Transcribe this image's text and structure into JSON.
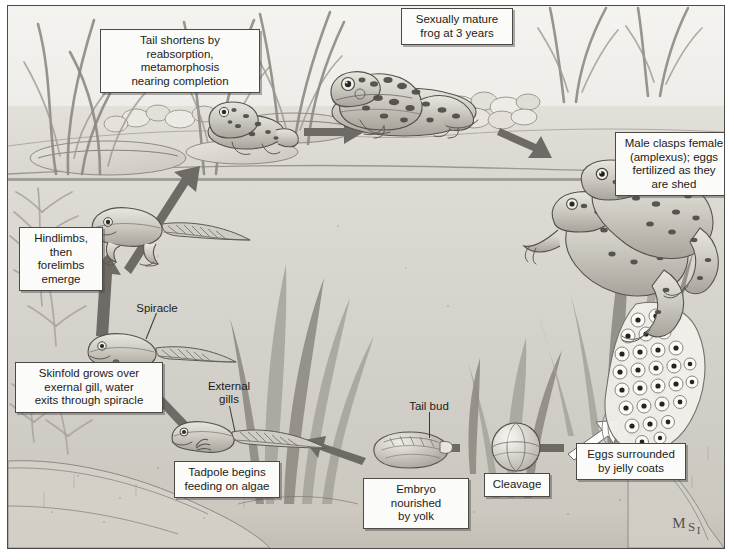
{
  "figure": {
    "artist_signature": {
      "line1": "M",
      "line2": "S",
      "line3": "I"
    },
    "palette": {
      "ink": "#1d1c1a",
      "label_fill": "#fbfbf9",
      "label_border": "#4c4a47",
      "arrow": "#6e6b66",
      "water": "#d2cfc8",
      "shore": "#ddd9d1",
      "plant": "#8b8880"
    }
  },
  "labels": {
    "tail_shortens": "Tail shortens by\nreabsorption, metamorphosis\nnearing completion",
    "sexually_mature": "Sexually mature\nfrog at 3 years",
    "amplexus": "Male clasps female\n(amplexus); eggs\nfertilized as they\nare shed",
    "hindlimbs": "Hindlimbs,\nthen forelimbs\nemerge",
    "skinfold": "Skinfold grows over\nexernal gill, water\nexits through spiracle",
    "tadpole_feeding": "Tadpole begins\nfeeding on algae",
    "embryo_yolk": "Embryo nourished\nby yolk",
    "cleavage": "Cleavage",
    "eggs_jelly": "Eggs surrounded\nby jelly coats"
  },
  "annotations": {
    "spiracle": "Spiracle",
    "external_gills": "External\ngills",
    "tail_bud": "Tail bud"
  },
  "stages": [
    {
      "id": "amplexus",
      "name": "Male clasps female (amplexus); eggs fertilized as they are shed",
      "order": 1
    },
    {
      "id": "eggs-jelly",
      "name": "Eggs surrounded by jelly coats",
      "order": 2
    },
    {
      "id": "cleavage",
      "name": "Cleavage",
      "order": 3
    },
    {
      "id": "embryo-yolk",
      "name": "Embryo nourished by yolk",
      "order": 4
    },
    {
      "id": "tadpole-feeding",
      "name": "Tadpole begins feeding on algae",
      "order": 5
    },
    {
      "id": "skinfold",
      "name": "Skinfold grows over exernal gill, water exits through spiracle",
      "order": 6
    },
    {
      "id": "hindlimbs",
      "name": "Hindlimbs, then forelimbs emerge",
      "order": 7
    },
    {
      "id": "tail-shortens",
      "name": "Tail shortens by reabsorption, metamorphosis nearing completion",
      "order": 8
    },
    {
      "id": "sexually-mature",
      "name": "Sexually mature frog at 3 years",
      "order": 9
    }
  ]
}
